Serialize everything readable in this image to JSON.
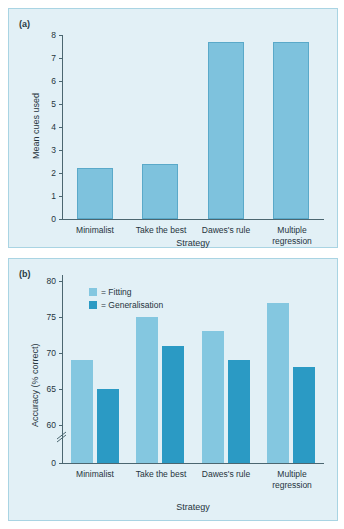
{
  "figure": {
    "background": "#ffffff",
    "panel_background": "#e2f0f6",
    "panel_border": "#a9d4e3",
    "axis_color": "#4b6670",
    "colors": {
      "fitting": "#84c7e0",
      "generalisation": "#2b9ac4",
      "cues": "#7ec2dd"
    }
  },
  "panel_a": {
    "label": "(a)",
    "chart_data": {
      "type": "bar",
      "title": "",
      "xlabel": "Strategy",
      "ylabel": "Mean cues used",
      "categories": [
        "Minimalist",
        "Take the best",
        "Dawes's rule",
        "Multiple regression"
      ],
      "values": [
        2.2,
        2.4,
        7.7,
        7.7
      ],
      "ylim": [
        0,
        8
      ],
      "yticks": [
        0,
        1,
        2,
        3,
        4,
        5,
        6,
        7,
        8
      ],
      "ytick_labels": [
        "0",
        "1",
        "2",
        "3",
        "4",
        "5",
        "6",
        "7",
        "8"
      ],
      "grid": false,
      "legend": "none",
      "series": [
        {
          "name": "Mean cues used",
          "color": "#7ec2dd",
          "values": [
            2.2,
            2.4,
            7.7,
            7.7
          ]
        }
      ]
    }
  },
  "panel_b": {
    "label": "(b)",
    "chart_data": {
      "type": "bar",
      "title": "",
      "xlabel": "Strategy",
      "ylabel": "Accuracy (% correct)",
      "categories": [
        "Minimalist",
        "Take the best",
        "Dawes's rule",
        "Multiple regression"
      ],
      "ylim": [
        60,
        80
      ],
      "yticks": [
        0,
        60,
        65,
        70,
        75,
        80
      ],
      "ytick_labels": [
        "0",
        "60",
        "65",
        "70",
        "75",
        "80"
      ],
      "axis_break": true,
      "axis_break_note": "y-axis broken between 0 and 60",
      "grid": false,
      "legend": "upper-left",
      "series": [
        {
          "name": "= Fitting",
          "color": "#84c7e0",
          "values": [
            69,
            75,
            73,
            77
          ]
        },
        {
          "name": "= Generalisation",
          "color": "#2b9ac4",
          "values": [
            65,
            71,
            69,
            68
          ]
        }
      ]
    },
    "legend": [
      {
        "label": "= Fitting",
        "color": "#84c7e0"
      },
      {
        "label": "= Generalisation",
        "color": "#2b9ac4"
      }
    ]
  }
}
